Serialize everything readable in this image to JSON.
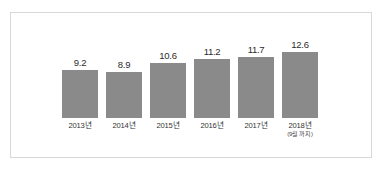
{
  "chart_data": {
    "type": "bar",
    "title": "",
    "subtitle": "",
    "xlabel": "",
    "ylabel": "",
    "grid": false,
    "legend": null,
    "ylim": [
      0,
      14
    ],
    "categories": [
      "2013년",
      "2014년",
      "2015년",
      "2016년",
      "2017년",
      "2018년"
    ],
    "category_sublabels": [
      "",
      "",
      "",
      "",
      "",
      "(9월 까지)"
    ],
    "values": [
      9.2,
      8.9,
      10.6,
      11.2,
      11.7,
      12.6
    ],
    "value_labels": [
      "9.2",
      "8.9",
      "10.6",
      "11.2",
      "11.7",
      "12.6"
    ],
    "bar_color": "#8a8a8a",
    "background_color": "#ffffff",
    "frame_color": "#d8d8d8"
  }
}
